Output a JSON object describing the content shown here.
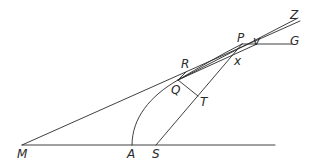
{
  "figure": {
    "width": 316,
    "height": 167,
    "stroke_color": "#2a2a2a",
    "background": "#ffffff"
  },
  "points": {
    "M": {
      "label": "M",
      "x": 22,
      "y": 145
    },
    "A": {
      "label": "A",
      "x": 132,
      "y": 145
    },
    "S": {
      "label": "S",
      "x": 156,
      "y": 145
    },
    "Q": {
      "label": "Q",
      "x": 178,
      "y": 80
    },
    "T": {
      "label": "T",
      "x": 198,
      "y": 96
    },
    "R": {
      "label": "R",
      "x": 186,
      "y": 70
    },
    "P": {
      "label": "P",
      "x": 242,
      "y": 44
    },
    "x": {
      "label": "x",
      "x": 232,
      "y": 57
    },
    "v": {
      "label": "v",
      "x": 257,
      "y": 44
    },
    "G": {
      "label": "G",
      "x": 292,
      "y": 44
    },
    "Z": {
      "label": "Z",
      "x": 300,
      "y": 21
    }
  },
  "labels": {
    "M": "M",
    "A": "A",
    "S": "S",
    "Q": "Q",
    "T": "T",
    "R": "R",
    "P": "P",
    "x": "x",
    "v": "v",
    "G": "G",
    "Z": "Z"
  },
  "segments": [
    {
      "name": "baseline",
      "from": "M",
      "to": "end",
      "desc": "axis line through M, A, S"
    },
    {
      "name": "tangent-MZ",
      "from": "M",
      "to": "Z",
      "desc": "tangent through R and P to Z"
    },
    {
      "name": "line-PZ-second",
      "from": "Q",
      "to": "Z",
      "desc": "chord Q to Z through P"
    },
    {
      "name": "line-SP",
      "from": "S",
      "to": "P",
      "desc": "radius from focus S through T and x to P"
    },
    {
      "name": "line-QT",
      "from": "Q",
      "to": "T",
      "desc": "perpendicular QT"
    },
    {
      "name": "line-Qv",
      "from": "Q",
      "to": "v",
      "desc": "line Q through x to v"
    },
    {
      "name": "line-PG",
      "from": "P",
      "to": "G",
      "desc": "line P v G parallel to axis"
    },
    {
      "name": "line-RQ",
      "from": "R",
      "to": "Q",
      "desc": "short segment RQ"
    }
  ],
  "curves": [
    {
      "name": "parabola-arc-AP",
      "desc": "conic arc from A through Q to P"
    }
  ]
}
